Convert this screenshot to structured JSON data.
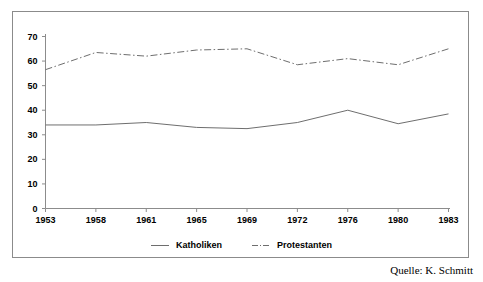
{
  "chart_data": {
    "type": "line",
    "title": "",
    "subtitle": "",
    "xlabel": "",
    "ylabel": "",
    "x": [
      1953,
      1958,
      1961,
      1965,
      1969,
      1972,
      1976,
      1980,
      1983
    ],
    "categories": [
      "1953",
      "1958",
      "1961",
      "1965",
      "1969",
      "1972",
      "1976",
      "1980",
      "1983"
    ],
    "xlim": [
      1953,
      1983
    ],
    "ylim": [
      0,
      70
    ],
    "y_ticks": [
      0,
      10,
      20,
      30,
      40,
      50,
      60,
      70
    ],
    "x_ticks": [
      "1953",
      "1958",
      "1961",
      "1965",
      "1969",
      "1972",
      "1976",
      "1980",
      "1983"
    ],
    "grid": false,
    "legend_position": "bottom-center",
    "series": [
      {
        "name": "Katholiken",
        "style": "solid",
        "color": "#6e6e6e",
        "values": [
          34,
          34,
          35,
          33,
          32.5,
          35,
          40,
          34.5,
          38.5
        ]
      },
      {
        "name": "Protestanten",
        "style": "dash-dot",
        "color": "#6e6e6e",
        "values": [
          56.5,
          63.5,
          62,
          64.5,
          65,
          58.5,
          61,
          58.5,
          65
        ]
      }
    ],
    "annotations": [
      {
        "name": "source",
        "text": "Quelle: K. Schmitt"
      }
    ]
  },
  "legend": {
    "entries": [
      {
        "label": "Katholiken"
      },
      {
        "label": "Protestanten"
      }
    ]
  },
  "source": {
    "text": "Quelle: K. Schmitt"
  },
  "colors": {
    "line": "#6e6e6e",
    "axis": "#8c8c8c",
    "frame": "#8b8b8b",
    "text": "#000000",
    "background": "#ffffff"
  }
}
